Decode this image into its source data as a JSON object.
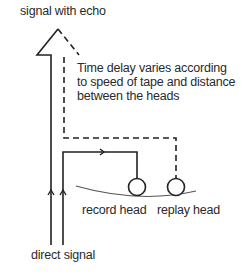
{
  "diagram": {
    "title_top": "signal with echo",
    "note": {
      "lines": [
        "Time delay varies according",
        "to speed of tape and distance",
        "between the heads"
      ]
    },
    "heads": {
      "record": "record head",
      "replay": "replay head"
    },
    "bottom_label": "direct signal",
    "colors": {
      "line": "#222222",
      "tape": "#555555",
      "background": "#ffffff"
    }
  }
}
